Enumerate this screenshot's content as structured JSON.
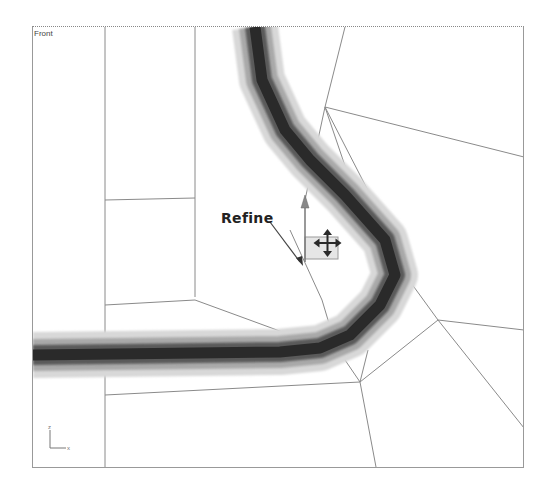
{
  "viewport": {
    "label": "Front"
  },
  "callout": {
    "text": "Refine"
  },
  "gizmo": {
    "axis_x": "x",
    "axis_z": "z"
  },
  "colors": {
    "stroke_dark": "#2a2a2a",
    "mesh_line": "#8a8a8a",
    "border": "#999999"
  }
}
